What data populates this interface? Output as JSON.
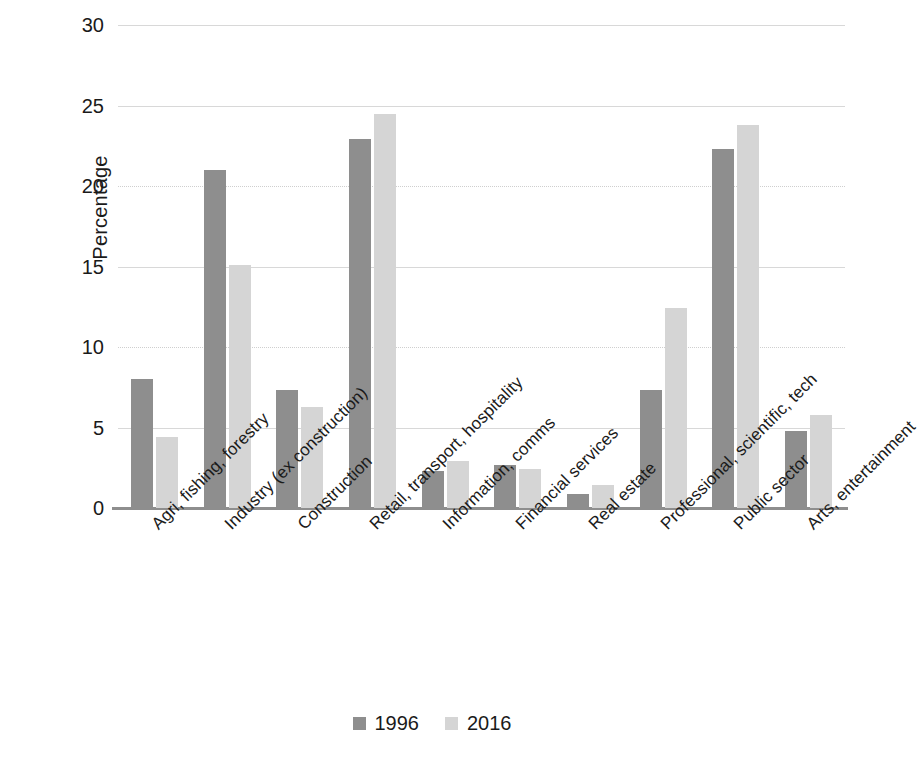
{
  "chart_data": {
    "type": "bar",
    "title": "",
    "subtitle": "",
    "xlabel": "",
    "ylabel": "Percentage",
    "ylim": [
      0,
      30
    ],
    "ytick_step": 5,
    "yticks": [
      "30",
      "25",
      "20",
      "15",
      "10",
      "5",
      "0"
    ],
    "grid": true,
    "legend_position": "bottom-center",
    "categories": [
      "Agri, fishing, forestry",
      "Industry (ex construction)",
      "Construction",
      "Retail, transport, hospitality",
      "Information, comms",
      "Financial services",
      "Real estate",
      "Professional, scientific, tech",
      "Public sector",
      "Arts, entertainment"
    ],
    "series": [
      {
        "name": "1996",
        "color": "#8e8e8e",
        "values": [
          8.0,
          21.0,
          7.3,
          22.9,
          2.3,
          2.7,
          0.9,
          7.3,
          22.3,
          4.8
        ]
      },
      {
        "name": "2016",
        "color": "#d5d5d5",
        "values": [
          4.4,
          15.1,
          6.3,
          24.5,
          2.9,
          2.4,
          1.4,
          12.4,
          23.8,
          5.8
        ]
      }
    ]
  },
  "axis": {
    "y_title": "Percentage"
  },
  "legend": {
    "items": [
      {
        "label": "1996",
        "swatch": "legend-swatch-1996"
      },
      {
        "label": "2016",
        "swatch": "legend-swatch-2016"
      }
    ]
  }
}
